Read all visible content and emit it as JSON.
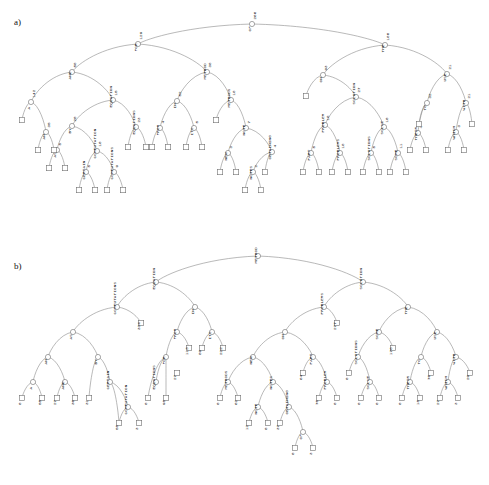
{
  "figure": {
    "type": "tree-diagram-pair",
    "panels": [
      {
        "id": "a",
        "label": "a)",
        "label_x": 14,
        "label_y": 24
      },
      {
        "id": "b",
        "label": "b)",
        "label_x": 14,
        "label_y": 268
      }
    ],
    "style": {
      "edge_color": "#8a8a8a",
      "node_stroke": "#6f6f6f",
      "node_fill": "#ffffff",
      "text_color": "#111111",
      "background": "#ffffff",
      "label_rotation_deg": -90
    }
  },
  "panel_a": {
    "caption": "a)",
    "root": {
      "word": "OF",
      "count": "266"
    },
    "internal_nodes": [
      {
        "id": "a_root",
        "word": "OF",
        "count": "266",
        "x": 252,
        "y": 24
      },
      {
        "id": "a_for",
        "word": "FOR",
        "count": "129",
        "x": 138,
        "y": 44
      },
      {
        "id": "a_the",
        "word": "THE",
        "count": "180",
        "x": 385,
        "y": 45
      },
      {
        "id": "a_and",
        "word": "AND",
        "count": "58",
        "x": 72,
        "y": 72
      },
      {
        "id": "a_n38",
        "word": "METHOD",
        "count": "38",
        "x": 207,
        "y": 72
      },
      {
        "id": "a_on",
        "word": "ON",
        "count": "93",
        "x": 323,
        "y": 75
      },
      {
        "id": "a_use",
        "word": "USE",
        "count": "21",
        "x": 447,
        "y": 74
      },
      {
        "id": "a_a",
        "word": "A",
        "count": "142",
        "x": 31,
        "y": 102
      },
      {
        "id": "a_eq",
        "word": "EQUATION",
        "count": "15",
        "x": 113,
        "y": 100
      },
      {
        "id": "a_in",
        "word": "IN",
        "count": "52",
        "x": 177,
        "y": 101
      },
      {
        "id": "a_methods",
        "word": "METHODS",
        "count": "18",
        "x": 231,
        "y": 100
      },
      {
        "id": "a_solution",
        "word": "SOLUTION",
        "count": "27",
        "x": 356,
        "y": 97
      },
      {
        "id": "a_to",
        "word": "TO",
        "count": "32",
        "x": 427,
        "y": 103
      },
      {
        "id": "a_with",
        "word": "WITH",
        "count": "21",
        "x": 466,
        "y": 103
      },
      {
        "id": "a_an",
        "word": "AN",
        "count": "35",
        "x": 46,
        "y": 132
      },
      {
        "id": "a_by",
        "word": "BY",
        "count": "20",
        "x": 72,
        "y": 126
      },
      {
        "id": "a_equations",
        "word": "EQUATIONS",
        "count": "23",
        "x": 136,
        "y": 127
      },
      {
        "id": "a_from",
        "word": "FROM",
        "count": "4",
        "x": 160,
        "y": 128
      },
      {
        "id": "a_its",
        "word": "ITS",
        "count": "5",
        "x": 194,
        "y": 128
      },
      {
        "id": "a_note",
        "word": "NOTE",
        "count": "7",
        "x": 246,
        "y": 128
      },
      {
        "id": "a_problem",
        "word": "PROBLEM",
        "count": "18",
        "x": 325,
        "y": 125
      },
      {
        "id": "a_solve",
        "word": "SOLVE",
        "count": "10",
        "x": 384,
        "y": 127
      },
      {
        "id": "a_their",
        "word": "THEIR",
        "count": "4",
        "x": 418,
        "y": 133
      },
      {
        "id": "a_which",
        "word": "WHICH",
        "count": "3",
        "x": 456,
        "y": 132
      },
      {
        "id": "a_as",
        "word": "AS",
        "count": "5",
        "x": 57,
        "y": 150
      },
      {
        "id": "a_computation",
        "word": "COMPUTATION",
        "count": "10",
        "x": 97,
        "y": 151
      },
      {
        "id": "a_new",
        "word": "NEW",
        "count": "3",
        "x": 228,
        "y": 153
      },
      {
        "id": "a_obtaining",
        "word": "OBTAINING",
        "count": "4",
        "x": 272,
        "y": 152
      },
      {
        "id": "a_part",
        "word": "PART",
        "count": "5",
        "x": 311,
        "y": 153
      },
      {
        "id": "a_problems",
        "word": "PROBLEMS",
        "count": "18",
        "x": 340,
        "y": 153
      },
      {
        "id": "a_solutions",
        "word": "SOLUTIONS",
        "count": "5",
        "x": 371,
        "y": 153
      },
      {
        "id": "a_some",
        "word": "SOME",
        "count": "11",
        "x": 398,
        "y": 153
      },
      {
        "id": "a_certain",
        "word": "CERTAIN",
        "count": "5",
        "x": 86,
        "y": 172
      },
      {
        "id": "a_computations",
        "word": "COMPUTATIONS",
        "count": "9",
        "x": 114,
        "y": 172
      },
      {
        "id": "a_notes",
        "word": "NOTES",
        "count": "2",
        "x": 253,
        "y": 172
      }
    ],
    "leaves": [
      {
        "x": 22,
        "y": 120
      },
      {
        "x": 38,
        "y": 150
      },
      {
        "x": 54,
        "y": 150
      },
      {
        "x": 49,
        "y": 168
      },
      {
        "x": 65,
        "y": 168
      },
      {
        "x": 79,
        "y": 190
      },
      {
        "x": 95,
        "y": 190
      },
      {
        "x": 107,
        "y": 190
      },
      {
        "x": 123,
        "y": 190
      },
      {
        "x": 128,
        "y": 147
      },
      {
        "x": 146,
        "y": 147
      },
      {
        "x": 152,
        "y": 147
      },
      {
        "x": 168,
        "y": 147
      },
      {
        "x": 186,
        "y": 147
      },
      {
        "x": 202,
        "y": 147
      },
      {
        "x": 216,
        "y": 120
      },
      {
        "x": 220,
        "y": 172
      },
      {
        "x": 236,
        "y": 172
      },
      {
        "x": 245,
        "y": 190
      },
      {
        "x": 261,
        "y": 190
      },
      {
        "x": 265,
        "y": 172
      },
      {
        "x": 303,
        "y": 172
      },
      {
        "x": 319,
        "y": 172
      },
      {
        "x": 332,
        "y": 172
      },
      {
        "x": 348,
        "y": 172
      },
      {
        "x": 306,
        "y": 96
      },
      {
        "x": 363,
        "y": 172
      },
      {
        "x": 379,
        "y": 172
      },
      {
        "x": 390,
        "y": 172
      },
      {
        "x": 406,
        "y": 172
      },
      {
        "x": 410,
        "y": 150
      },
      {
        "x": 426,
        "y": 150
      },
      {
        "x": 419,
        "y": 124
      },
      {
        "x": 448,
        "y": 150
      },
      {
        "x": 464,
        "y": 150
      },
      {
        "x": 472,
        "y": 124
      }
    ],
    "word_labels": [
      "OF",
      "FOR",
      "THE",
      "AND",
      "METHOD",
      "ON",
      "USE",
      "A",
      "EQUATION",
      "IN",
      "METHODS",
      "SOLUTION",
      "TO",
      "WITH",
      "AN",
      "BY",
      "EQUATIONS",
      "FROM",
      "ITS",
      "NOTE",
      "PROBLEM",
      "SOLVE",
      "THEIR",
      "WHICH",
      "AS",
      "COMPUTATION",
      "NEW",
      "OBTAINING",
      "PART",
      "PROBLEMS",
      "SOLUTIONS",
      "SOME",
      "CERTAIN",
      "COMPUTATIONS",
      "NOTES"
    ],
    "counts": [
      "266",
      "129",
      "180",
      "58",
      "38",
      "93",
      "21",
      "142",
      "15",
      "52",
      "18",
      "27",
      "32",
      "21",
      "35",
      "20",
      "23",
      "4",
      "5",
      "7",
      "18",
      "10",
      "4",
      "3",
      "5",
      "10",
      "3",
      "4",
      "5",
      "18",
      "5",
      "11",
      "5",
      "9",
      "2"
    ]
  },
  "panel_b": {
    "caption": "b)",
    "root": {
      "word": "METHOD",
      "count": ""
    },
    "internal_nodes": [
      {
        "id": "b_root",
        "word": "METHOD",
        "count": "",
        "x": 258,
        "y": 256
      },
      {
        "id": "b_equation",
        "word": "EQUATION",
        "count": "",
        "x": 156,
        "y": 282
      },
      {
        "id": "b_solution",
        "word": "SOLUTION",
        "count": "",
        "x": 363,
        "y": 282
      },
      {
        "id": "b_computations",
        "word": "COMPUTATIONS",
        "count": "",
        "x": 117,
        "y": 307
      },
      {
        "id": "b_in",
        "word": "IN",
        "count": "",
        "x": 195,
        "y": 307
      },
      {
        "id": "b_problems",
        "word": "PROBLEMS",
        "count": "",
        "x": 324,
        "y": 307
      },
      {
        "id": "b_the",
        "word": "THE",
        "count": "",
        "x": 408,
        "y": 307
      },
      {
        "id": "b_as",
        "word": "AS",
        "count": "",
        "x": 73,
        "y": 332
      },
      {
        "id": "b_from",
        "word": "FROM",
        "count": "",
        "x": 177,
        "y": 332
      },
      {
        "id": "b_its",
        "word": "ITS",
        "count": "",
        "x": 212,
        "y": 332
      },
      {
        "id": "b_on",
        "word": "ON",
        "count": "",
        "x": 285,
        "y": 332
      },
      {
        "id": "b_some",
        "word": "SOME",
        "count": "",
        "x": 379,
        "y": 332
      },
      {
        "id": "b_use",
        "word": "USE",
        "count": "",
        "x": 437,
        "y": 332
      },
      {
        "id": "b_an",
        "word": "AN",
        "count": "",
        "x": 48,
        "y": 357
      },
      {
        "id": "b_by",
        "word": "BY",
        "count": "",
        "x": 98,
        "y": 357
      },
      {
        "id": "b_for",
        "word": "FOR",
        "count": "",
        "x": 166,
        "y": 357
      },
      {
        "id": "b_new",
        "word": "NEW",
        "count": "",
        "x": 253,
        "y": 357
      },
      {
        "id": "b_part",
        "word": "PART",
        "count": "",
        "x": 313,
        "y": 357
      },
      {
        "id": "b_solutions",
        "word": "SOLUTIONS",
        "count": "",
        "x": 358,
        "y": 357
      },
      {
        "id": "b_to",
        "word": "TO",
        "count": "",
        "x": 421,
        "y": 357
      },
      {
        "id": "b_with",
        "word": "WITH",
        "count": "",
        "x": 456,
        "y": 357
      },
      {
        "id": "b_a",
        "word": "A",
        "count": "",
        "x": 33,
        "y": 382
      },
      {
        "id": "b_and",
        "word": "AND",
        "count": "",
        "x": 65,
        "y": 382
      },
      {
        "id": "b_certain",
        "word": "CERTAIN",
        "count": "",
        "x": 110,
        "y": 382
      },
      {
        "id": "b_equations",
        "word": "EQUATIONS",
        "count": "",
        "x": 156,
        "y": 382
      },
      {
        "id": "b_methods",
        "word": "METHODS",
        "count": "",
        "x": 228,
        "y": 382
      },
      {
        "id": "b_notes",
        "word": "NOTES",
        "count": "",
        "x": 273,
        "y": 382
      },
      {
        "id": "b_problem",
        "word": "PROBLEM",
        "count": "",
        "x": 327,
        "y": 382
      },
      {
        "id": "b_solve",
        "word": "SOLVE",
        "count": "",
        "x": 370,
        "y": 382
      },
      {
        "id": "b_their",
        "word": "THEIR",
        "count": "",
        "x": 410,
        "y": 382
      },
      {
        "id": "b_which",
        "word": "WHICH",
        "count": "",
        "x": 448,
        "y": 382
      },
      {
        "id": "b_computation",
        "word": "COMPUTATION",
        "count": "",
        "x": 128,
        "y": 407
      },
      {
        "id": "b_note",
        "word": "NOTE",
        "count": "",
        "x": 258,
        "y": 407
      },
      {
        "id": "b_obtaining",
        "word": "OBTAINING",
        "count": "",
        "x": 289,
        "y": 407
      },
      {
        "id": "b_of",
        "word": "OF",
        "count": "",
        "x": 303,
        "y": 432
      }
    ],
    "leaves": [
      {
        "value": "0",
        "x": 22,
        "y": 398
      },
      {
        "value": "55",
        "x": 42,
        "y": 398
      },
      {
        "value": "27",
        "x": 57,
        "y": 398
      },
      {
        "value": "36",
        "x": 75,
        "y": 398
      },
      {
        "value": "31",
        "x": 89,
        "y": 398
      },
      {
        "value": "58",
        "x": 119,
        "y": 423
      },
      {
        "value": "3",
        "x": 139,
        "y": 423
      },
      {
        "value": "334",
        "x": 141,
        "y": 323
      },
      {
        "value": "0",
        "x": 148,
        "y": 398
      },
      {
        "value": "98",
        "x": 166,
        "y": 398
      },
      {
        "value": "27",
        "x": 177,
        "y": 373
      },
      {
        "value": "113",
        "x": 189,
        "y": 348
      },
      {
        "value": "89",
        "x": 202,
        "y": 348
      },
      {
        "value": "222",
        "x": 223,
        "y": 348
      },
      {
        "value": "0",
        "x": 220,
        "y": 398
      },
      {
        "value": "62",
        "x": 238,
        "y": 398
      },
      {
        "value": "12",
        "x": 249,
        "y": 423
      },
      {
        "value": "0",
        "x": 268,
        "y": 423
      },
      {
        "value": "37",
        "x": 280,
        "y": 423
      },
      {
        "value": "0",
        "x": 295,
        "y": 448
      },
      {
        "value": "3",
        "x": 313,
        "y": 448
      },
      {
        "value": "64",
        "x": 303,
        "y": 373
      },
      {
        "value": "70",
        "x": 319,
        "y": 398
      },
      {
        "value": "0",
        "x": 337,
        "y": 398
      },
      {
        "value": "277",
        "x": 337,
        "y": 323
      },
      {
        "value": "0",
        "x": 349,
        "y": 373
      },
      {
        "value": "0",
        "x": 361,
        "y": 398
      },
      {
        "value": "0",
        "x": 379,
        "y": 398
      },
      {
        "value": "170",
        "x": 393,
        "y": 348
      },
      {
        "value": "0",
        "x": 402,
        "y": 398
      },
      {
        "value": "18",
        "x": 420,
        "y": 398
      },
      {
        "value": "76",
        "x": 431,
        "y": 373
      },
      {
        "value": "27",
        "x": 440,
        "y": 398
      },
      {
        "value": "3",
        "x": 458,
        "y": 398
      },
      {
        "value": "29",
        "x": 470,
        "y": 373
      }
    ],
    "word_labels": [
      "METHOD",
      "EQUATION",
      "SOLUTION",
      "COMPUTATIONS",
      "IN",
      "PROBLEMS",
      "THE",
      "AS",
      "FROM",
      "ITS",
      "ON",
      "SOME",
      "USE",
      "AN",
      "BY",
      "FOR",
      "NEW",
      "PART",
      "SOLUTIONS",
      "TO",
      "WITH",
      "A",
      "AND",
      "CERTAIN",
      "EQUATIONS",
      "METHODS",
      "NOTES",
      "PROBLEM",
      "SOLVE",
      "THEIR",
      "WHICH",
      "COMPUTATION",
      "NOTE",
      "OBTAINING",
      "OF"
    ],
    "leaf_values": [
      "0",
      "55",
      "27",
      "36",
      "31",
      "58",
      "3",
      "334",
      "0",
      "98",
      "27",
      "113",
      "89",
      "222",
      "0",
      "62",
      "12",
      "0",
      "37",
      "0",
      "3",
      "64",
      "70",
      "0",
      "277",
      "0",
      "0",
      "0",
      "170",
      "0",
      "18",
      "76",
      "27",
      "3",
      "29"
    ]
  }
}
